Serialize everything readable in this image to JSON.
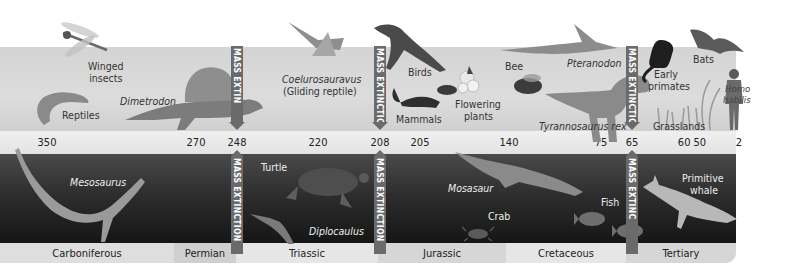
{
  "timeline": {
    "unit": "millions of years ago",
    "ticks": [
      {
        "label": "350",
        "x": 47
      },
      {
        "label": "270",
        "x": 196
      },
      {
        "label": "248",
        "x": 237
      },
      {
        "label": "220",
        "x": 318
      },
      {
        "label": "208",
        "x": 380
      },
      {
        "label": "205",
        "x": 420
      },
      {
        "label": "140",
        "x": 509
      },
      {
        "label": "75",
        "x": 601
      },
      {
        "label": "65",
        "x": 632
      },
      {
        "label": "60 50",
        "x": 692
      },
      {
        "label": "2",
        "x": 739
      }
    ]
  },
  "mass_extinctions": [
    {
      "label": "MASS EXTINCTION",
      "upper_label": "MASS EXTIN",
      "lower_label": "MASS EXTINCTION",
      "at": "248"
    },
    {
      "label": "MASS EXTINCTION",
      "upper_label": "MASS EXTINCTION",
      "lower_label": "MASS EXTINCTION",
      "at": "208"
    },
    {
      "label": "MASS EXTINCTION",
      "upper_label": "MASS EXTINCTION",
      "lower_label": "MASS EXTINC",
      "at": "65"
    }
  ],
  "land_life": [
    {
      "label": "Winged\ninsects",
      "italic": false
    },
    {
      "label": "Reptiles",
      "italic": false
    },
    {
      "label": "Dimetrodon",
      "italic": true
    },
    {
      "label": "Coelurosauravus",
      "italic": true
    },
    {
      "label": "(Gliding reptile)",
      "italic": false
    },
    {
      "label": "Birds",
      "italic": false
    },
    {
      "label": "Mammals",
      "italic": false
    },
    {
      "label": "Flowering",
      "italic": false
    },
    {
      "label": "plants",
      "italic": false
    },
    {
      "label": "Bee",
      "italic": false
    },
    {
      "label": "Pteranodon",
      "italic": true
    },
    {
      "label": "Tyrannosaurus rex",
      "italic": true
    },
    {
      "label": "Early",
      "italic": false
    },
    {
      "label": "primates",
      "italic": false
    },
    {
      "label": "Grasslands",
      "italic": false
    },
    {
      "label": "Bats",
      "italic": false
    },
    {
      "label": "Homo",
      "italic": true
    },
    {
      "label": "habilis",
      "italic": true
    }
  ],
  "sea_life": [
    {
      "label": "Mesosaurus",
      "italic": true
    },
    {
      "label": "Turtle",
      "italic": false
    },
    {
      "label": "Diplocaulus",
      "italic": true
    },
    {
      "label": "Mosasaur",
      "italic": true
    },
    {
      "label": "Crab",
      "italic": false
    },
    {
      "label": "Fish",
      "italic": false
    },
    {
      "label": "Primitive",
      "italic": false
    },
    {
      "label": "whale",
      "italic": false
    }
  ],
  "periods": [
    {
      "label": "Carboniferous",
      "width": 174,
      "bg": "#dedede"
    },
    {
      "label": "Permian",
      "width": 62,
      "bg": "#cfcfcf"
    },
    {
      "label": "Triassic",
      "width": 142,
      "bg": "#e6e6e6"
    },
    {
      "label": "Jurassic",
      "width": 128,
      "bg": "#d6d6d6"
    },
    {
      "label": "Cretaceous",
      "width": 120,
      "bg": "#e6e6e6"
    },
    {
      "label": "Tertiary",
      "width": 110,
      "bg": "#d6d6d6"
    }
  ],
  "colors": {
    "land_band": "#d6d6d6",
    "sea_band": "#2a2a2a",
    "extinction_bar": "#6a6a6a",
    "text_dark": "#222222",
    "text_light": "#eeeeee"
  }
}
